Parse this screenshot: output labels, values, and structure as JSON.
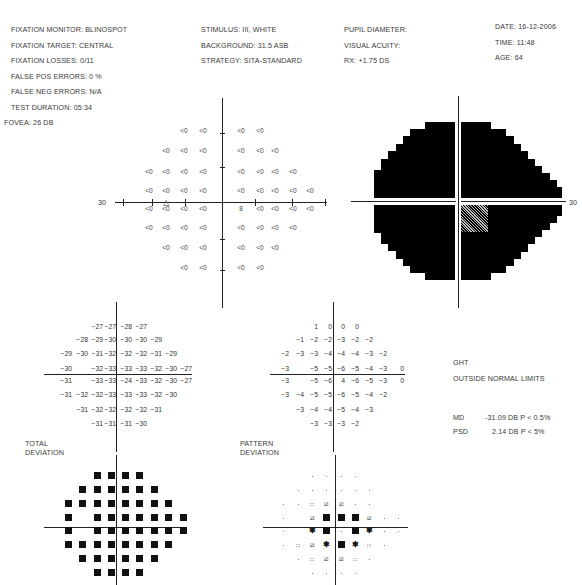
{
  "header": {
    "col1": [
      "FIXATION MONITOR: BLINOSPOT",
      "FIXATION TARGET: CENTRAL",
      "FIXATION LOSSES: 0/11",
      "FALSE POS ERRORS: 0 %",
      "FALSE NEG ERRORS: N/A",
      "TEST DURATION: 05:34"
    ],
    "col2": [
      "STIMULUS: III, WHITE",
      "BACKGROUND: 31.5 ASB",
      "STRATEGY: SITA-STANDARD"
    ],
    "col3": [
      "PUPIL DIAMETER:",
      "VISUAL ACUITY:",
      "RX: +1.75 DS"
    ],
    "col4": [
      "DATE: 16-12-2006",
      "TIME: 11:48",
      "AGE: 64"
    ],
    "fovea": "FOVEA: 26 DB"
  },
  "threshold_plot": {
    "axis_label_left": "30",
    "blind_spot_marker": "△",
    "center_value": "8"
  },
  "grayscale_plot": {
    "axis_label_right": "30"
  },
  "labels": {
    "total_deviation": [
      "TOTAL",
      "DEVIATION"
    ],
    "pattern_deviation": [
      "PATTERN",
      "DEVIATION"
    ]
  },
  "ght": {
    "title": "GHT",
    "result": "OUTSIDE NORMAL LIMITS"
  },
  "indices": {
    "md_label": "MD",
    "md_value": "-31.09 DB P < 0.5%",
    "psd_label": "PSD",
    "psd_value": "2.14 DB P < 5%"
  },
  "chart_data": [
    {
      "type": "table",
      "title": "Threshold values (dB), 24-2",
      "rows": [
        [
          "",
          "",
          "",
          "<0",
          "<0",
          "<0",
          "<0",
          "",
          "",
          ""
        ],
        [
          "",
          "",
          "<0",
          "<0",
          "<0",
          "<0",
          "<0",
          "<0",
          "",
          ""
        ],
        [
          "",
          "<0",
          "<0",
          "<0",
          "<0",
          "<0",
          "<0",
          "<0",
          "<0",
          ""
        ],
        [
          "",
          "<0",
          "<0",
          "<0",
          "<0",
          "<0",
          "<0",
          "<0",
          "<0",
          "<0"
        ],
        [
          "",
          "<0",
          "<0",
          "<0",
          "<0",
          "8",
          "<0",
          "<0",
          "<0",
          "<0"
        ],
        [
          "",
          "<0",
          "<0",
          "<0",
          "<0",
          "<0",
          "<0",
          "<0",
          "<0",
          ""
        ],
        [
          "",
          "",
          "<0",
          "<0",
          "<0",
          "<0",
          "<0",
          "<0",
          "",
          ""
        ],
        [
          "",
          "",
          "",
          "<0",
          "<0",
          "<0",
          "<0",
          "",
          "",
          ""
        ]
      ],
      "xlim": [
        -30,
        30
      ],
      "annotation": "blind spot triangle at (-15, -3)"
    },
    {
      "type": "table",
      "title": "Total Deviation (dB)",
      "rows": [
        [
          null,
          null,
          null,
          -27,
          -27,
          -28,
          -27,
          null,
          null
        ],
        [
          null,
          null,
          -28,
          -29,
          -30,
          -30,
          -30,
          -29,
          null
        ],
        [
          null,
          -29,
          -30,
          -31,
          -32,
          -32,
          -32,
          -31,
          -29
        ],
        [
          null,
          -30,
          null,
          -32,
          -33,
          -33,
          -33,
          -32,
          -30,
          -27
        ],
        [
          null,
          -31,
          null,
          -33,
          -33,
          -24,
          -33,
          -32,
          -30,
          -27
        ],
        [
          null,
          -31,
          -32,
          -32,
          -33,
          -33,
          -33,
          -32,
          -30
        ],
        [
          null,
          null,
          -31,
          -32,
          -32,
          -32,
          -32,
          -31,
          null
        ],
        [
          null,
          null,
          null,
          -31,
          -31,
          -31,
          -30,
          null,
          null
        ]
      ]
    },
    {
      "type": "table",
      "title": "Pattern Deviation (dB)",
      "rows": [
        [
          null,
          null,
          null,
          1,
          0,
          0,
          0,
          null,
          null
        ],
        [
          null,
          null,
          -1,
          -2,
          -2,
          -3,
          -2,
          -2,
          null
        ],
        [
          null,
          -2,
          -3,
          -3,
          -4,
          -4,
          -4,
          -3,
          -2
        ],
        [
          null,
          -3,
          null,
          -5,
          -5,
          -6,
          -5,
          -4,
          -3,
          0
        ],
        [
          null,
          -3,
          null,
          -5,
          -6,
          4,
          -6,
          -5,
          -3,
          0
        ],
        [
          null,
          -3,
          -4,
          -5,
          -5,
          -6,
          -5,
          -4,
          -2
        ],
        [
          null,
          null,
          -3,
          -4,
          -4,
          -5,
          -4,
          -3,
          null
        ],
        [
          null,
          null,
          null,
          -3,
          -3,
          -3,
          -2,
          null,
          null
        ]
      ]
    },
    {
      "type": "heatmap",
      "title": "Total Deviation probability plot",
      "note": "all tested points p<0.5% (black squares) except blind spot locations"
    },
    {
      "type": "heatmap",
      "title": "Pattern Deviation probability plot",
      "legend": [
        "dot: normal",
        ":: p<5%",
        "diagonal: p<2%",
        "checker: p<1%",
        "black square: p<0.5%"
      ]
    }
  ]
}
